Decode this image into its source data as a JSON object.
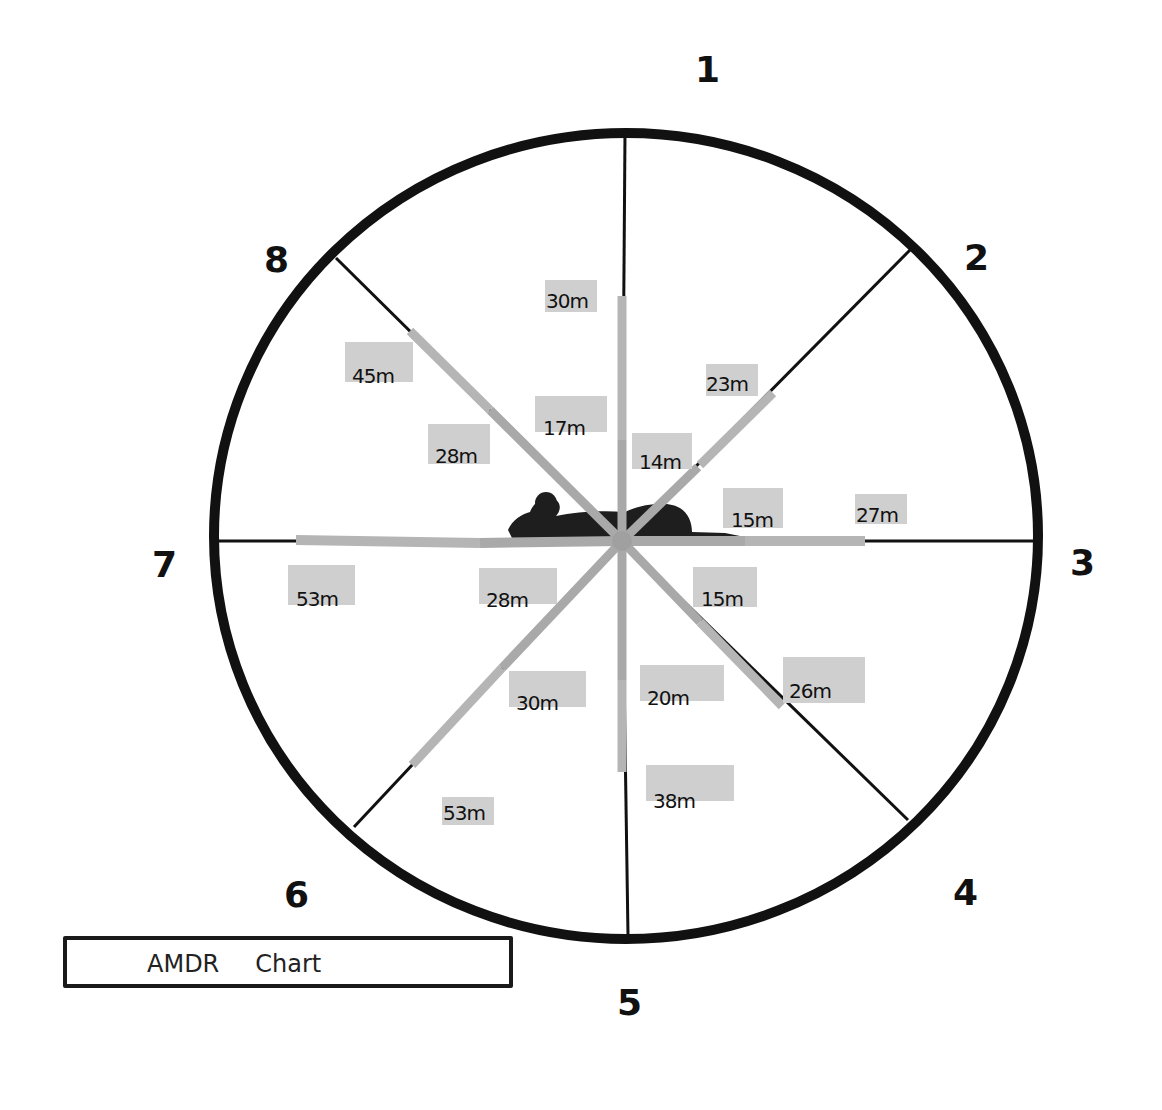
{
  "diagram": {
    "title_words": [
      "AMDR",
      "Chart"
    ],
    "center": [
      622,
      541
    ],
    "circle_radius": 410,
    "colors": {
      "circle": "#111111",
      "spoke": "#111111",
      "range_bar_inner": "#a9a9a9",
      "range_bar_outer": "#b4b4b4",
      "label_box": "#cfcfcf",
      "silhouette": "#1e1e1e"
    },
    "sectors": [
      {
        "number": "1",
        "angle_deg": -90,
        "inner_m": 17,
        "outer_m": 30,
        "inner_label": "17m",
        "outer_label": "30m"
      },
      {
        "number": "2",
        "angle_deg": -45,
        "inner_m": 14,
        "outer_m": 23,
        "inner_label": "14m",
        "outer_label": "23m"
      },
      {
        "number": "3",
        "angle_deg": 0,
        "inner_m": 15,
        "outer_m": 27,
        "inner_label": "15m",
        "outer_label": "27m"
      },
      {
        "number": "4",
        "angle_deg": 45,
        "inner_m": 15,
        "outer_m": 26,
        "inner_label": "15m",
        "outer_label": "26m"
      },
      {
        "number": "5",
        "angle_deg": 90,
        "inner_m": 20,
        "outer_m": 38,
        "inner_label": "20m",
        "outer_label": "38m"
      },
      {
        "number": "6",
        "angle_deg": 135,
        "inner_m": 30,
        "outer_m": 53,
        "inner_label": "30m",
        "outer_label": "53m"
      },
      {
        "number": "7",
        "angle_deg": 180,
        "inner_m": 28,
        "outer_m": 53,
        "inner_label": "28m",
        "outer_label": "53m"
      },
      {
        "number": "8",
        "angle_deg": -135,
        "inner_m": 28,
        "outer_m": 45,
        "inner_label": "28m",
        "outer_label": "45m"
      }
    ],
    "center_figure": "prone-person-silhouette"
  }
}
